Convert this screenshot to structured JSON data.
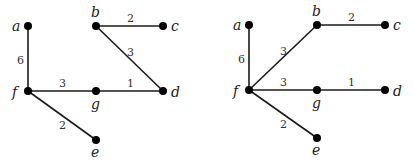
{
  "graphs": [
    {
      "name": "left-graph",
      "nodes": [
        {
          "id": "a",
          "label": "a",
          "x": 28,
          "y": 26,
          "lx": 12,
          "ly": 31
        },
        {
          "id": "b",
          "label": "b",
          "x": 96,
          "y": 26,
          "lx": 91,
          "ly": 17
        },
        {
          "id": "c",
          "label": "c",
          "x": 163,
          "y": 26,
          "lx": 171,
          "ly": 31
        },
        {
          "id": "f",
          "label": "f",
          "x": 28,
          "y": 91,
          "lx": 12,
          "ly": 97
        },
        {
          "id": "g",
          "label": "g",
          "x": 96,
          "y": 91,
          "lx": 91,
          "ly": 109
        },
        {
          "id": "d",
          "label": "d",
          "x": 163,
          "y": 91,
          "lx": 171,
          "ly": 97
        },
        {
          "id": "e",
          "label": "e",
          "x": 96,
          "y": 140,
          "lx": 91,
          "ly": 157
        }
      ],
      "edges": [
        {
          "from": "a",
          "to": "f",
          "weight": "6",
          "wx": 17,
          "wy": 64
        },
        {
          "from": "b",
          "to": "c",
          "weight": "2",
          "wx": 127,
          "wy": 22
        },
        {
          "from": "b",
          "to": "d",
          "weight": "3",
          "wx": 127,
          "wy": 56
        },
        {
          "from": "f",
          "to": "g",
          "weight": "3",
          "wx": 59,
          "wy": 87
        },
        {
          "from": "g",
          "to": "d",
          "weight": "1",
          "wx": 127,
          "wy": 87
        },
        {
          "from": "f",
          "to": "e",
          "weight": "2",
          "wx": 59,
          "wy": 129
        }
      ]
    },
    {
      "name": "right-graph",
      "nodes": [
        {
          "id": "a",
          "label": "a",
          "x": 249,
          "y": 25,
          "lx": 233,
          "ly": 30
        },
        {
          "id": "b",
          "label": "b",
          "x": 317,
          "y": 25,
          "lx": 312,
          "ly": 16
        },
        {
          "id": "c",
          "label": "c",
          "x": 385,
          "y": 25,
          "lx": 393,
          "ly": 30
        },
        {
          "id": "f",
          "label": "f",
          "x": 249,
          "y": 90,
          "lx": 233,
          "ly": 96
        },
        {
          "id": "g",
          "label": "g",
          "x": 317,
          "y": 90,
          "lx": 312,
          "ly": 108
        },
        {
          "id": "d",
          "label": "d",
          "x": 385,
          "y": 90,
          "lx": 393,
          "ly": 96
        },
        {
          "id": "e",
          "label": "e",
          "x": 317,
          "y": 138,
          "lx": 312,
          "ly": 155
        }
      ],
      "edges": [
        {
          "from": "a",
          "to": "f",
          "weight": "6",
          "wx": 238,
          "wy": 63
        },
        {
          "from": "f",
          "to": "b",
          "weight": "3",
          "wx": 280,
          "wy": 55
        },
        {
          "from": "b",
          "to": "c",
          "weight": "2",
          "wx": 348,
          "wy": 21
        },
        {
          "from": "f",
          "to": "g",
          "weight": "3",
          "wx": 280,
          "wy": 86
        },
        {
          "from": "g",
          "to": "d",
          "weight": "1",
          "wx": 348,
          "wy": 86
        },
        {
          "from": "f",
          "to": "e",
          "weight": "2",
          "wx": 280,
          "wy": 128
        }
      ]
    }
  ]
}
